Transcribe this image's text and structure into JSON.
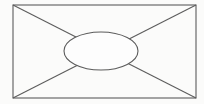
{
  "figure": {
    "canvas": {
      "width": 204,
      "height": 104,
      "background_color": "#fbfbfa"
    },
    "style": {
      "stroke_color": "#5c5c5c",
      "stroke_width": 1.1,
      "fill_color": "#fdfdfd"
    },
    "shapes": {
      "rectangle": {
        "name": "outer-rectangle",
        "x": 13,
        "y": 5,
        "width": 183,
        "height": 93,
        "fill": "none",
        "stroke": "#5c5c5c"
      },
      "diagonal_top_left_to_bottom_right": {
        "name": "diagonal-tl-br",
        "x1": 13,
        "y1": 5,
        "x2": 196,
        "y2": 98
      },
      "diagonal_bottom_left_to_top_right": {
        "name": "diagonal-bl-tr",
        "x1": 13,
        "y1": 98,
        "x2": 196,
        "y2": 5
      },
      "ellipse": {
        "name": "center-ellipse",
        "cx": 101,
        "cy": 51,
        "rx": 37,
        "ry": 19,
        "fill": "#fdfdfd",
        "stroke": "#5c5c5c"
      }
    }
  }
}
